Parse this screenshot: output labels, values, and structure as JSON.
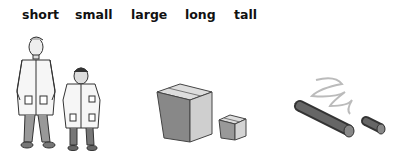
{
  "words": [
    {
      "label": "short",
      "x": 22
    },
    {
      "label": "small",
      "x": 75
    },
    {
      "label": "large",
      "x": 131
    },
    {
      "label": "long",
      "x": 185
    },
    {
      "label": "tall",
      "x": 234
    }
  ],
  "illustrations": [
    {
      "name": "doctors",
      "description": "tall doctor and short doctor in lab coats"
    },
    {
      "name": "boxes",
      "description": "large box and small box"
    },
    {
      "name": "rods",
      "description": "long rod and short rod with wavy string"
    }
  ]
}
